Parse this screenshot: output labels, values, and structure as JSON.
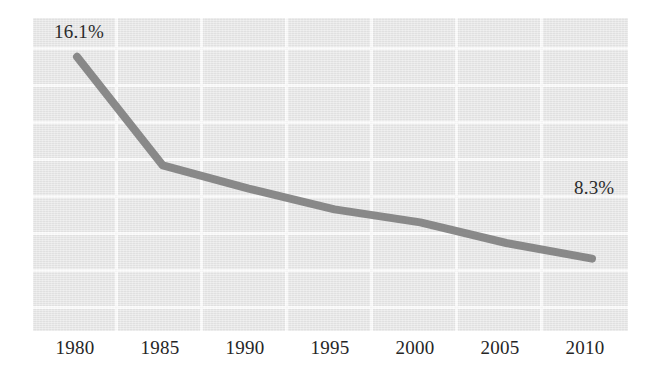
{
  "chart_data": {
    "type": "line",
    "title": "",
    "subtitle": "",
    "xlabel": "",
    "ylabel": "",
    "x": [
      1980,
      1985,
      1990,
      1995,
      2000,
      2005,
      2010
    ],
    "tick_labels": [
      "1980",
      "1985",
      "1990",
      "1995",
      "2000",
      "2005",
      "2010"
    ],
    "series": [
      {
        "name": "",
        "values": [
          16.1,
          11.9,
          11.0,
          10.2,
          9.7,
          8.9,
          8.3
        ],
        "color": "#808080"
      }
    ],
    "data_labels": [
      {
        "point": 1980,
        "text": "16.1%",
        "value": 16.1
      },
      {
        "point": 2010,
        "text": "8.3%",
        "value": 8.3
      }
    ],
    "ylim": [
      5.5,
      17.6
    ],
    "grid": true,
    "grid_color": "#fcfcfc",
    "horizontal_gridlines": 8,
    "vertical_gridlines": 7,
    "legend": "none",
    "plot_background": "#e7e7e7",
    "page_background": "#ffffff",
    "axis_label_color": "#262626"
  },
  "labels": {
    "start": "16.1%",
    "end": "8.3%"
  },
  "xaxis": {
    "ticks": [
      "1980",
      "1985",
      "1990",
      "1995",
      "2000",
      "2005",
      "2010"
    ]
  }
}
